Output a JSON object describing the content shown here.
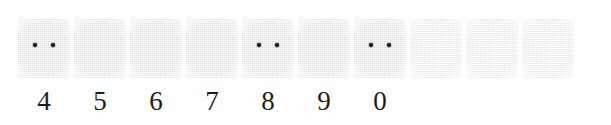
{
  "sheet": {
    "kind": "scanned-answer-bubble-strip",
    "background_color": "#ffffff",
    "cell_fill_color": "#f1f1f1",
    "mark_color": "#1a1a1a",
    "digit_color": "#1d1d1d"
  },
  "cells": [
    {
      "index": 1,
      "label": "4",
      "marks": 2,
      "faint": false
    },
    {
      "index": 2,
      "label": "5",
      "marks": 0,
      "faint": false
    },
    {
      "index": 3,
      "label": "6",
      "marks": 0,
      "faint": false
    },
    {
      "index": 4,
      "label": "7",
      "marks": 0,
      "faint": false
    },
    {
      "index": 5,
      "label": "8",
      "marks": 2,
      "faint": false
    },
    {
      "index": 6,
      "label": "9",
      "marks": 0,
      "faint": false
    },
    {
      "index": 7,
      "label": "0",
      "marks": 2,
      "faint": false
    },
    {
      "index": 8,
      "label": "",
      "marks": 0,
      "faint": true
    },
    {
      "index": 9,
      "label": "",
      "marks": 0,
      "faint": true
    },
    {
      "index": 10,
      "label": "",
      "marks": 0,
      "faint": true
    }
  ],
  "digits_sequence": "4 5 6 7 8 9 0",
  "marked_digits": [
    "4",
    "8",
    "0"
  ]
}
